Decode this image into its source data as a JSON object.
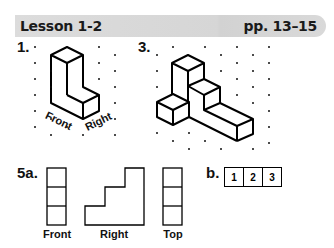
{
  "header": {
    "lesson": "Lesson 1-2",
    "pages": "pp. 13–15",
    "bar_color": "#d8d8d8"
  },
  "exercises": {
    "ex1": {
      "number": "1.",
      "figure": "isometric-dot-drawing-L-shaped-solid",
      "labels": {
        "front": "Front",
        "right": "Right"
      }
    },
    "ex3": {
      "number": "3.",
      "figure": "isometric-dot-drawing-stepped-solid"
    },
    "ex5a": {
      "number": "5a.",
      "views": [
        {
          "label": "Front",
          "shape": "column-of-3-squares"
        },
        {
          "label": "Right",
          "shape": "staircase-3-steps"
        },
        {
          "label": "Top",
          "shape": "column-of-3-squares"
        }
      ]
    },
    "ex5b": {
      "number": "b.",
      "cells": [
        "1",
        "2",
        "3"
      ]
    }
  }
}
